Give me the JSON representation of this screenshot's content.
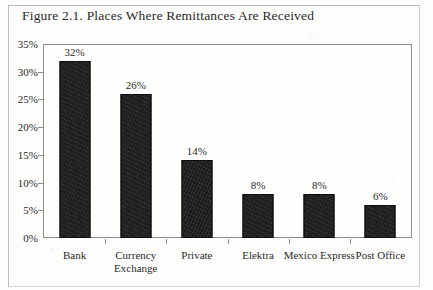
{
  "figure": {
    "title": "Figure 2.1. Places Where Remittances Are Received"
  },
  "chart_data": {
    "type": "bar",
    "title": "Figure 2.1. Places Where Remittances Are Received",
    "xlabel": "",
    "ylabel": "",
    "ylim": [
      0,
      35
    ],
    "ytick_labels": [
      "0%",
      "5%",
      "10%",
      "15%",
      "20%",
      "25%",
      "30%",
      "35%"
    ],
    "ytick_values": [
      0,
      5,
      10,
      15,
      20,
      25,
      30,
      35
    ],
    "grid": false,
    "legend": "none",
    "categories": [
      "Bank",
      "Currency Exchange",
      "Private",
      "Elektra",
      "Mexico Express",
      "Post Office"
    ],
    "values": [
      32,
      26,
      14,
      8,
      8,
      6
    ],
    "data_labels": [
      "32%",
      "26%",
      "14%",
      "8%",
      "8%",
      "6%"
    ],
    "bar_color": "#1b1b1b",
    "plot_background": "#fefefd",
    "axis_color": "#8d8d8a"
  }
}
